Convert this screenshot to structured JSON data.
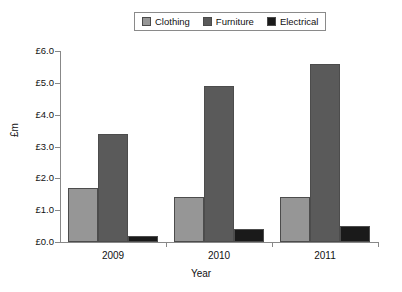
{
  "chart_data": {
    "type": "bar",
    "title": "",
    "subtitle": "",
    "xlabel": "Year",
    "ylabel": "£m",
    "categories": [
      "2009",
      "2010",
      "2011"
    ],
    "series": [
      {
        "name": "Clothing",
        "values": [
          1.7,
          1.4,
          1.4
        ],
        "color": "#969696"
      },
      {
        "name": "Furniture",
        "values": [
          3.4,
          4.9,
          5.6
        ],
        "color": "#5a5a5a"
      },
      {
        "name": "Electrical",
        "values": [
          0.2,
          0.4,
          0.5
        ],
        "color": "#1a1a1a"
      }
    ],
    "ylim": [
      0,
      6
    ],
    "ytick_values": [
      0.0,
      1.0,
      2.0,
      3.0,
      4.0,
      5.0,
      6.0
    ],
    "ytick_labels": [
      "£0.0",
      "£1.0",
      "£2.0",
      "£3.0",
      "£4.0",
      "£5.0",
      "£6.0"
    ],
    "grid": false,
    "legend_position": "top-center",
    "legend_entries": [
      "Clothing",
      "Furniture",
      "Electrical"
    ],
    "background_color": "#ffffff",
    "axis_color": "#888888"
  }
}
